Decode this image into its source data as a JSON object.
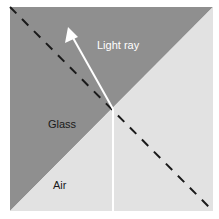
{
  "diagram": {
    "labels": {
      "ray": "Light ray",
      "glass": "Glass",
      "air": "Air"
    },
    "colors": {
      "glass": "#8f8f8f",
      "air": "#e2e2e2",
      "ray": "#ffffff",
      "normal": "#1a1a1a",
      "glass_text": "#1a1a1a",
      "air_text": "#1a1a1a",
      "ray_text": "#ffffff"
    },
    "elements": {
      "boundary": "Glass-air interface (diagonal)",
      "normal_line": "Dashed normal line",
      "incident_ray": "Vertical ray from bottom in air",
      "refracted_ray": "Ray bent toward the normal into glass with arrow"
    }
  }
}
